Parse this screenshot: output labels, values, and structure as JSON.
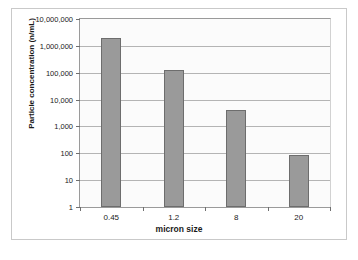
{
  "chart_data": {
    "type": "bar",
    "title": "",
    "xlabel": "micron size",
    "ylabel": "Particle concentration (n/mL)",
    "categories": [
      "0.45",
      "1.2",
      "8",
      "20"
    ],
    "values": [
      2000000,
      130000,
      4000,
      90
    ],
    "yscale": "log",
    "ylim": [
      1,
      10000000
    ],
    "ytick_labels": [
      "10,000,000",
      "1,000,000",
      "100,000",
      "10,000",
      "1,000",
      "100",
      "10",
      "1"
    ],
    "ytick_values": [
      10000000,
      1000000,
      100000,
      10000,
      1000,
      100,
      10,
      1
    ],
    "grid": true,
    "legend": false,
    "series_color": "#9a9a9a",
    "bar_edge_color": "#6d6d6d",
    "plot_background": "#fbfbfb",
    "frame_color": "#c9c9c9"
  }
}
